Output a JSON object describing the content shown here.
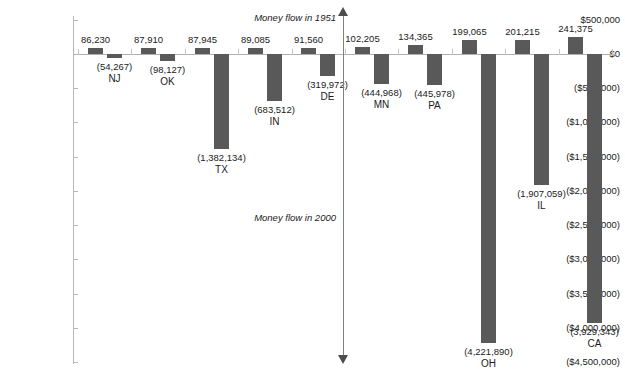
{
  "chart_data": {
    "type": "bar",
    "title": "",
    "xlabel": "",
    "ylabel": "",
    "ylim": [
      -4500000,
      500000
    ],
    "grid": false,
    "legend_position": "none",
    "orientation": "vertical",
    "categories": [
      "NJ",
      "OK",
      "TX",
      "IN",
      "DE",
      "MN",
      "PA",
      "OH",
      "IL",
      "CA"
    ],
    "y_ticks": [
      "$500,000",
      "$0",
      "($500,000)",
      "($1,000,000)",
      "($1,500,000)",
      "($2,000,000)",
      "($2,500,000)",
      "($3,000,000)",
      "($3,500,000)",
      "($4,000,000)",
      "($4,500,000)"
    ],
    "y_tick_values": [
      500000,
      0,
      -500000,
      -1000000,
      -1500000,
      -2000000,
      -2500000,
      -3000000,
      -3500000,
      -4000000,
      -4500000
    ],
    "series": [
      {
        "name": "Money flow in 1951",
        "values": [
          86230,
          87910,
          87945,
          89085,
          91560,
          102205,
          134365,
          199065,
          201215,
          241375
        ],
        "labels": [
          "86,230",
          "87,910",
          "87,945",
          "89,085",
          "91,560",
          "102,205",
          "134,365",
          "199,065",
          "201,215",
          "241,375"
        ],
        "color": "#595959"
      },
      {
        "name": "Money flow in 2000",
        "values": [
          -54267,
          -98127,
          -1382134,
          -683512,
          -319972,
          -444968,
          -445978,
          -4221890,
          -1907059,
          -3929343
        ],
        "labels": [
          "(54,267)",
          "(98,127)",
          "(1,382,134)",
          "(683,512)",
          "(319,972)",
          "(444,968)",
          "(445,978)",
          "(4,221,890)",
          "(1,907,059)",
          "(3,929,343)"
        ],
        "color": "#595959"
      }
    ],
    "annotations": [
      {
        "text": "Money flow in 1951",
        "position": "top-center"
      },
      {
        "text": "Money flow in 2000",
        "position": "middle-center"
      }
    ],
    "accent_color": "#595959",
    "axis_color": "#b8b8b8",
    "background": "#ffffff"
  }
}
